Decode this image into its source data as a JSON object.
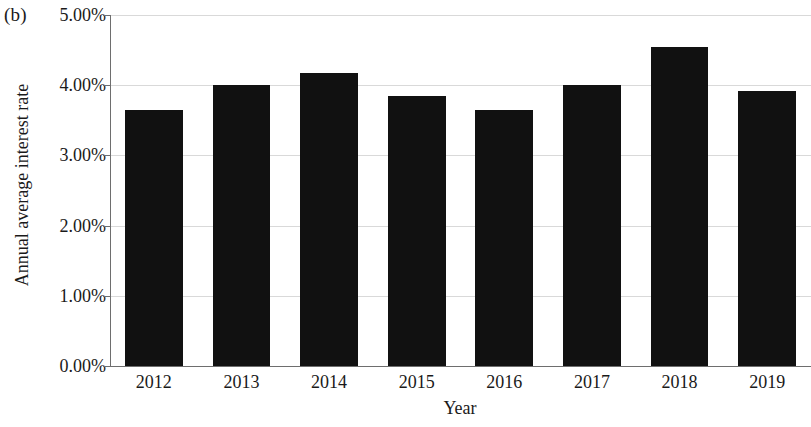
{
  "figure": {
    "panel_label": "(b)"
  },
  "chart_data": {
    "type": "bar",
    "title": "",
    "panel_label": "(b)",
    "xlabel": "Year",
    "ylabel": "Annual average interest rate",
    "categories": [
      "2012",
      "2013",
      "2014",
      "2015",
      "2016",
      "2017",
      "2018",
      "2019"
    ],
    "values": [
      3.65,
      4.0,
      4.18,
      3.85,
      3.65,
      4.0,
      4.55,
      3.92
    ],
    "value_labels": [
      "3.65%",
      "4.00%",
      "4.18%",
      "3.85%",
      "3.65%",
      "4.00%",
      "4.55%",
      "3.92%"
    ],
    "ylim": [
      0,
      5
    ],
    "ytick_values": [
      0,
      1,
      2,
      3,
      4,
      5
    ],
    "ytick_labels": [
      "0.00%",
      "1.00%",
      "2.00%",
      "3.00%",
      "4.00%",
      "5.00%"
    ],
    "value_unit": "percent",
    "grid": "horizontal",
    "legend": "none",
    "bar_color": "#111111",
    "gridline_color": "#d9d9d9",
    "axis_color": "#6e6e6e",
    "background_color": "#ffffff"
  }
}
